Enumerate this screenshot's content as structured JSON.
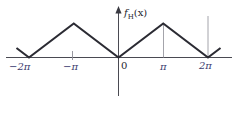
{
  "figure": {
    "background_color": "#ffffff",
    "width": 236,
    "height": 117,
    "axis_color": "#4a4a52",
    "curve_color": "#2b2b33",
    "guide_color": "#9a9aa2",
    "label_color": "#3b3b6e"
  },
  "chart_data": {
    "type": "line",
    "title": "",
    "subtitle": "",
    "xlabel": "",
    "ylabel": "f_H(x)",
    "ylabel_parts": {
      "base": "f",
      "subscript": "H",
      "argument": "(x)"
    },
    "grid": false,
    "legend": null,
    "legend_position": "none",
    "xlim": [
      -2.55,
      2.55
    ],
    "ylim": [
      -0.55,
      1.35
    ],
    "x_unit": "pi",
    "xticks": [
      -2,
      -1,
      0,
      1,
      2
    ],
    "xticklabels": [
      "−2π",
      "−π",
      "0",
      "π",
      "2π"
    ],
    "yticks": [],
    "yticklabels": [],
    "series": [
      {
        "name": "f_H(x)",
        "description": "Triangular wave, period 2π, vertices at multiples of 2π with value 0 and peaks at odd multiples of π with value 1",
        "x": [
          -2.28,
          -2.0,
          -1.0,
          0.0,
          1.0,
          2.0,
          2.28
        ],
        "y": [
          0.28,
          0.0,
          1.0,
          0.0,
          1.0,
          0.0,
          0.28
        ]
      }
    ],
    "annotations": [
      {
        "name": "guide-pi",
        "type": "vertical-segment",
        "x": 1.0,
        "y0": 0.0,
        "y1": 1.0
      },
      {
        "name": "guide-2pi",
        "type": "vertical-segment",
        "x": 2.0,
        "y0": 0.0,
        "y1": 1.22
      },
      {
        "name": "tick-minus-pi",
        "type": "tick",
        "x": -1.0,
        "y0": -0.06,
        "y1": 0.1
      }
    ]
  },
  "labels": {
    "x_minus_2pi": "−2π",
    "x_minus_pi": "−π",
    "x_zero": "0",
    "x_pi": "π",
    "x_2pi": "2π",
    "y_axis_title_base": "f",
    "y_axis_title_sub": "H",
    "y_axis_title_arg": "(x)"
  }
}
